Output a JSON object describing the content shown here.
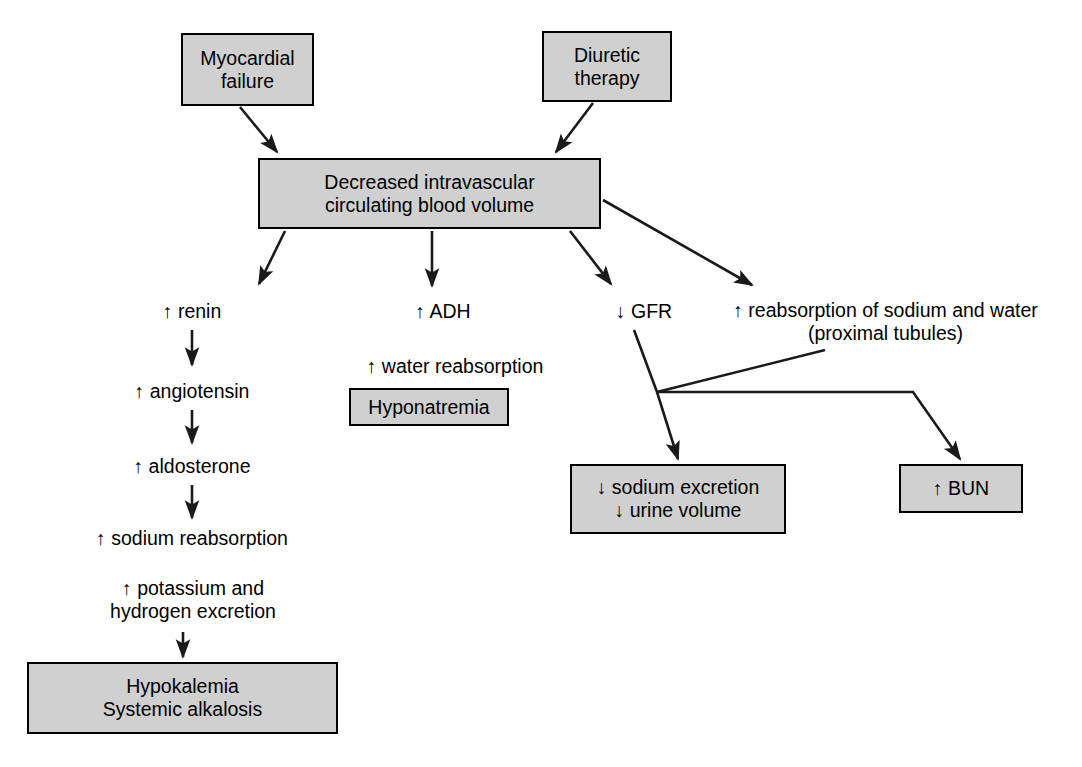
{
  "diagram": {
    "colors": {
      "box_fill": "#d0d0d0",
      "box_border": "#000000",
      "text": "#000000",
      "edge": "#1a1a1a",
      "background": "#ffffff"
    },
    "nodes": [
      {
        "id": "myocardial-failure",
        "label": "Myocardial\nfailure",
        "shape": "box",
        "x": 181,
        "y": 33,
        "w": 133,
        "h": 73
      },
      {
        "id": "diuretic-therapy",
        "label": "Diuretic\ntherapy",
        "shape": "box",
        "x": 542,
        "y": 31,
        "w": 130,
        "h": 71
      },
      {
        "id": "decreased-volume",
        "label": "Decreased intravascular\ncirculating blood volume",
        "shape": "box",
        "x": 258,
        "y": 158,
        "w": 343,
        "h": 71
      },
      {
        "id": "renin",
        "label": "↑ renin",
        "shape": "text",
        "x": 132,
        "y": 298,
        "w": 120,
        "h": 26
      },
      {
        "id": "angiotensin",
        "label": "↑ angiotensin",
        "shape": "text",
        "x": 106,
        "y": 378,
        "w": 172,
        "h": 26
      },
      {
        "id": "aldosterone",
        "label": "↑ aldosterone",
        "shape": "text",
        "x": 106,
        "y": 453,
        "w": 172,
        "h": 26
      },
      {
        "id": "sodium-reabsorption",
        "label": "↑ sodium reabsorption",
        "shape": "text",
        "x": 61,
        "y": 525,
        "w": 262,
        "h": 26
      },
      {
        "id": "potassium-hydrogen-excretion",
        "label": "↑ potassium and\nhydrogen excretion",
        "shape": "text",
        "x": 82,
        "y": 574,
        "w": 222,
        "h": 52
      },
      {
        "id": "hypokalemia-alkalosis",
        "label": "Hypokalemia\nSystemic alkalosis",
        "shape": "box",
        "x": 27,
        "y": 662,
        "w": 311,
        "h": 72
      },
      {
        "id": "adh",
        "label": "↑ ADH",
        "shape": "text",
        "x": 388,
        "y": 298,
        "w": 110,
        "h": 26
      },
      {
        "id": "water-reabsorption",
        "label": "↑ water reabsorption",
        "shape": "text",
        "x": 335,
        "y": 353,
        "w": 240,
        "h": 26
      },
      {
        "id": "hyponatremia",
        "label": "Hyponatremia",
        "shape": "box",
        "x": 349,
        "y": 388,
        "w": 160,
        "h": 38
      },
      {
        "id": "gfr",
        "label": "↓ GFR",
        "shape": "text",
        "x": 594,
        "y": 298,
        "w": 100,
        "h": 26
      },
      {
        "id": "reabsorption-sodium-water",
        "label": "↑ reabsorption of sodium and water\n(proximal tubules)",
        "shape": "text",
        "x": 718,
        "y": 296,
        "w": 335,
        "h": 52
      },
      {
        "id": "sodium-urine-decrease",
        "label": "↓ sodium excretion\n↓ urine volume",
        "shape": "box",
        "x": 570,
        "y": 464,
        "w": 216,
        "h": 70
      },
      {
        "id": "bun",
        "label": "↑ BUN",
        "shape": "box",
        "x": 899,
        "y": 464,
        "w": 124,
        "h": 49
      }
    ],
    "edges": [
      {
        "id": "edge-myocardial-to-volume",
        "from": "myocardial-failure",
        "to": "decreased-volume",
        "arrow": true
      },
      {
        "id": "edge-diuretic-to-volume",
        "from": "diuretic-therapy",
        "to": "decreased-volume",
        "arrow": true
      },
      {
        "id": "edge-volume-to-renin",
        "from": "decreased-volume",
        "to": "renin",
        "arrow": true
      },
      {
        "id": "edge-volume-to-adh",
        "from": "decreased-volume",
        "to": "adh",
        "arrow": true
      },
      {
        "id": "edge-volume-to-gfr",
        "from": "decreased-volume",
        "to": "gfr",
        "arrow": true
      },
      {
        "id": "edge-volume-to-reabsorption",
        "from": "decreased-volume",
        "to": "reabsorption-sodium-water",
        "arrow": true
      },
      {
        "id": "edge-renin-to-angiotensin",
        "from": "renin",
        "to": "angiotensin",
        "arrow": true
      },
      {
        "id": "edge-angiotensin-to-aldosterone",
        "from": "angiotensin",
        "to": "aldosterone",
        "arrow": true
      },
      {
        "id": "edge-aldosterone-to-sodium",
        "from": "aldosterone",
        "to": "sodium-reabsorption",
        "arrow": true
      },
      {
        "id": "edge-potassium-to-hypokalemia",
        "from": "potassium-hydrogen-excretion",
        "to": "hypokalemia-alkalosis",
        "arrow": true
      },
      {
        "id": "edge-gfr-to-sodium-urine",
        "from": "gfr",
        "to": "sodium-urine-decrease",
        "arrow": true
      },
      {
        "id": "edge-reabsorption-to-junction",
        "from": "reabsorption-sodium-water",
        "to": "junction",
        "arrow": false
      },
      {
        "id": "edge-junction-to-bun",
        "from": "junction",
        "to": "bun",
        "arrow": true
      }
    ]
  }
}
